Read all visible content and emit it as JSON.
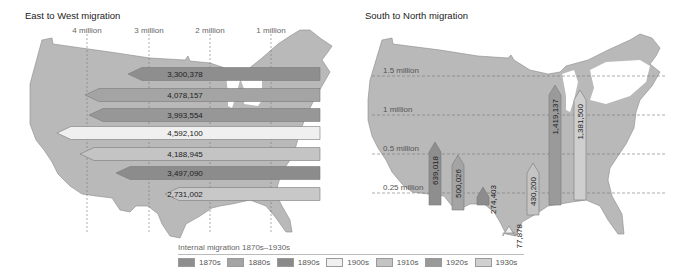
{
  "chart_data": [
    {
      "type": "bar",
      "orientation": "horizontal",
      "title": "East to West migration",
      "xlabel": "",
      "ylabel": "",
      "axis_ticks": [
        "4 million",
        "3 million",
        "2 million",
        "1 million"
      ],
      "axis_direction": "right-to-left (arrows point west)",
      "grid": true,
      "categories": [
        "1870s",
        "1880s",
        "1890s",
        "1900s",
        "1910s",
        "1920s",
        "1930s"
      ],
      "values": [
        3300378,
        4078157,
        3993554,
        4592100,
        4188945,
        3497090,
        2731002
      ],
      "labels": [
        "3,300,378",
        "4,078,157",
        "3,993,554",
        "4,592,100",
        "4,188,945",
        "3,497,090",
        "2,731,002"
      ]
    },
    {
      "type": "bar",
      "orientation": "vertical",
      "title": "South to North migration",
      "xlabel": "",
      "ylabel": "",
      "axis_ticks": [
        "0.25 million",
        "0.5 million",
        "1 million",
        "1.5 million"
      ],
      "grid": true,
      "categories": [
        "1870s",
        "1880s",
        "1890s",
        "1900s",
        "1910s",
        "1920s",
        "1930s"
      ],
      "values": [
        639018,
        500026,
        274403,
        77878,
        430200,
        1419137,
        1381500
      ],
      "labels": [
        "639,018",
        "500,026",
        "274,403",
        "77,878",
        "430,200",
        "1,419,137",
        "1,381,500"
      ]
    }
  ],
  "panels": {
    "left_title": "East to West migration",
    "right_title": "South to North migration",
    "left_ticks": [
      {
        "label": "4 million",
        "x": 87
      },
      {
        "label": "3 million",
        "x": 149
      },
      {
        "label": "2 million",
        "x": 210
      },
      {
        "label": "1 million",
        "x": 271
      }
    ],
    "right_ticks": [
      {
        "label": "1.5 million",
        "y": 76
      },
      {
        "label": "1 million",
        "y": 115
      },
      {
        "label": "0.5 million",
        "y": 154
      },
      {
        "label": "0.25 million",
        "y": 193
      }
    ]
  },
  "ew_arrows": [
    {
      "label": "3,300,378",
      "tip": 128,
      "y": 74,
      "color": "#8e8e8e"
    },
    {
      "label": "4,078,157",
      "tip": 85,
      "y": 95,
      "color": "#a4a4a4"
    },
    {
      "label": "3,993,554",
      "tip": 89,
      "y": 115,
      "color": "#979797"
    },
    {
      "label": "4,592,100",
      "tip": 57,
      "y": 133,
      "color": "#f0f0f0"
    },
    {
      "label": "4,188,945",
      "tip": 80,
      "y": 154,
      "color": "#c4c4c4"
    },
    {
      "label": "3,497,090",
      "tip": 116,
      "y": 173,
      "color": "#8c8c8c"
    },
    {
      "label": "2,731,002",
      "tip": 165,
      "y": 194,
      "color": "#c8c8c8"
    }
  ],
  "sn_arrows": [
    {
      "label": "639,018",
      "x": 435,
      "tip": 142,
      "base": 205,
      "color": "#8e8e8e"
    },
    {
      "label": "500,026",
      "x": 458,
      "tip": 155,
      "base": 210,
      "color": "#a4a4a4"
    },
    {
      "label": "274,403",
      "x": 483,
      "tip": 187,
      "base": 205,
      "color": "#8c8c8c"
    },
    {
      "label": "77,878",
      "x": 509,
      "tip": 226,
      "base": 233,
      "color": "#f0f0f0"
    },
    {
      "label": "430,200",
      "x": 533,
      "tip": 163,
      "base": 215,
      "color": "#c4c4c4"
    },
    {
      "label": "1,419,137",
      "x": 555,
      "tip": 85,
      "base": 205,
      "color": "#9a9a9a"
    },
    {
      "label": "1,381,500",
      "x": 580,
      "tip": 90,
      "base": 200,
      "color": "#cfcfcf"
    }
  ],
  "legend": {
    "title": "Internal migration 1870s–1930s",
    "items": [
      {
        "label": "1870s",
        "color": "#8e8e8e"
      },
      {
        "label": "1880s",
        "color": "#a4a4a4"
      },
      {
        "label": "1890s",
        "color": "#8a8a8a"
      },
      {
        "label": "1900s",
        "color": "#f0f0f0"
      },
      {
        "label": "1910s",
        "color": "#c4c4c4"
      },
      {
        "label": "1920s",
        "color": "#999999"
      },
      {
        "label": "1930s",
        "color": "#d0d0d0"
      }
    ]
  },
  "colors": {
    "map_fill": "#b9b9b9",
    "map_stroke": "#8a8a8a",
    "grid_line": "#777777"
  }
}
